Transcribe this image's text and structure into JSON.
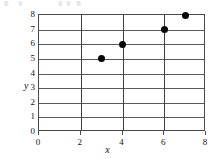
{
  "figure": {
    "artifact_note": "faint scan artifact",
    "axis_titles": {
      "x": "x",
      "y": "y"
    }
  },
  "chart_data": {
    "type": "scatter",
    "title": "",
    "xlabel": "x",
    "ylabel": "y",
    "xlim": [
      0,
      8
    ],
    "ylim": [
      0,
      8
    ],
    "grid": true,
    "legend": false,
    "x_ticks": [
      0,
      2,
      4,
      6,
      8
    ],
    "x_tick_labels": [
      "0",
      "2",
      "4",
      "6",
      "8"
    ],
    "x_gridlines": [
      2,
      4,
      6
    ],
    "y_ticks": [
      0,
      1,
      2,
      3,
      4,
      5,
      6,
      7,
      8
    ],
    "y_tick_labels": [
      "0",
      "1",
      "2",
      "3",
      "4",
      "5",
      "6",
      "7",
      "8"
    ],
    "series": [
      {
        "name": "points",
        "marker": "filled-circle",
        "color": "#080808",
        "points": [
          {
            "x": 3,
            "y": 5
          },
          {
            "x": 4,
            "y": 6
          },
          {
            "x": 6,
            "y": 7
          },
          {
            "x": 7,
            "y": 8
          }
        ]
      }
    ]
  }
}
